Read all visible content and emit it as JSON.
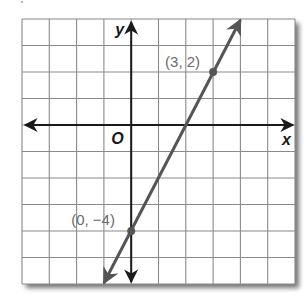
{
  "chart_data": {
    "type": "line",
    "title": "",
    "xlabel": "x",
    "ylabel": "y",
    "origin_label": "O",
    "xlim": [
      -4,
      6
    ],
    "ylim": [
      -6,
      4
    ],
    "grid": true,
    "grid_step": 1,
    "line": {
      "equation": "y = 2x - 4",
      "slope": 2,
      "intercept": -4,
      "arrows": "both",
      "color": "#555555"
    },
    "points": [
      {
        "x": 3,
        "y": 2,
        "label": "(3, 2)"
      },
      {
        "x": 0,
        "y": -4,
        "label": "(0, −4)"
      }
    ],
    "colors": {
      "grid": "#8a8a8a",
      "axes": "#1a1a1a",
      "line": "#555555",
      "point_label": "#6b6b6b",
      "shadow": "#9a9a9a"
    }
  }
}
